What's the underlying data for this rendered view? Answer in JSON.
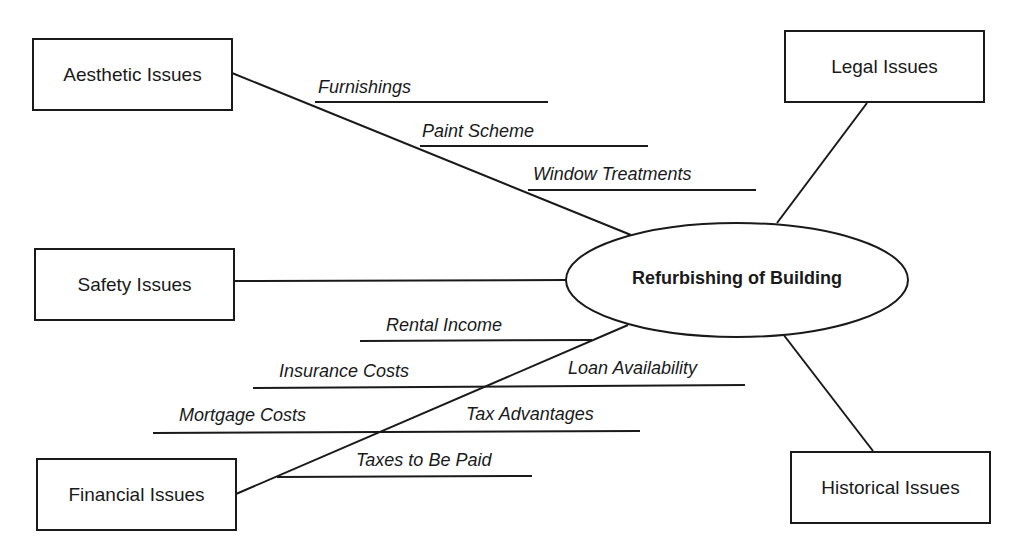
{
  "diagram": {
    "type": "mind-map",
    "center": {
      "label": "Refurbishing of Building"
    },
    "categories": [
      {
        "id": "aesthetic",
        "label": "Aesthetic Issues",
        "subtopics": [
          "Furnishings",
          "Paint Scheme",
          "Window Treatments"
        ]
      },
      {
        "id": "legal",
        "label": "Legal Issues",
        "subtopics": []
      },
      {
        "id": "safety",
        "label": "Safety Issues",
        "subtopics": []
      },
      {
        "id": "financial",
        "label": "Financial Issues",
        "subtopics": [
          "Rental Income",
          "Insurance Costs",
          "Loan Availability",
          "Mortgage Costs",
          "Tax Advantages",
          "Taxes to Be Paid"
        ]
      },
      {
        "id": "historical",
        "label": "Historical Issues",
        "subtopics": []
      }
    ],
    "colors": {
      "line": "#1a1a1a",
      "background": "#ffffff"
    }
  }
}
